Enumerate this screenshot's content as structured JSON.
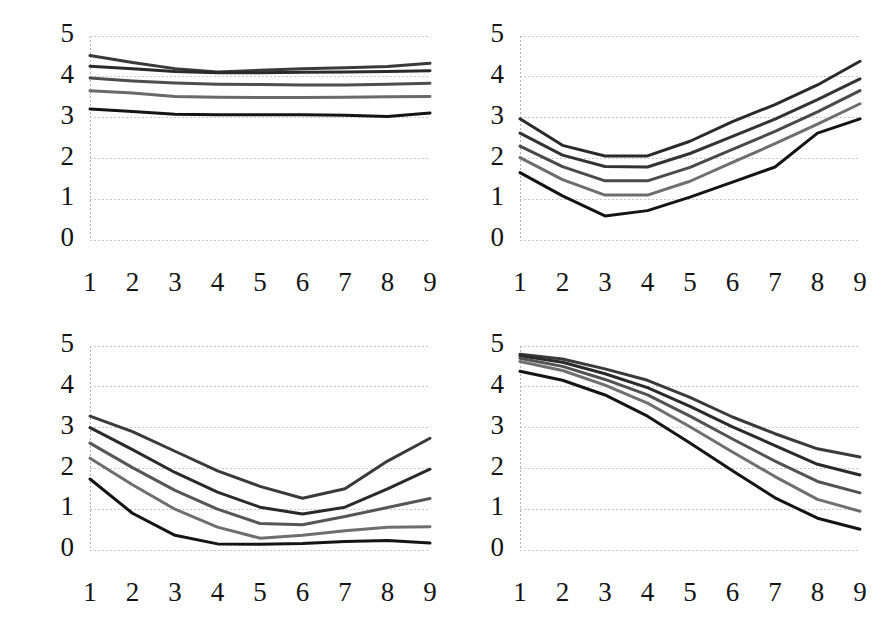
{
  "figure": {
    "background_color": "#ffffff",
    "panel_count": 4,
    "gridline_color": "#c9c9c9",
    "tick_label_color": "#141414"
  },
  "chart_data": [
    {
      "id": "panel-top-left",
      "type": "line",
      "title": "",
      "subtitle": "",
      "xlabel": "",
      "ylabel": "",
      "x": [
        1,
        2,
        3,
        4,
        5,
        6,
        7,
        8,
        9
      ],
      "xtick_labels": [
        "1",
        "2",
        "3",
        "4",
        "5",
        "6",
        "7",
        "8",
        "9"
      ],
      "ytick_labels": [
        "0",
        "1",
        "2",
        "3",
        "4",
        "5"
      ],
      "yticks": [
        0,
        1,
        2,
        3,
        4,
        5
      ],
      "ylim": [
        0,
        5
      ],
      "xlim": [
        1,
        9
      ],
      "grid": true,
      "grid_axis": "y",
      "legend": "none",
      "series": [
        {
          "name": "series-1",
          "color": "#3a3a3a",
          "values": [
            4.52,
            4.35,
            4.2,
            4.12,
            4.16,
            4.2,
            4.22,
            4.25,
            4.33
          ]
        },
        {
          "name": "series-2",
          "color": "#2a2a2a",
          "values": [
            4.26,
            4.2,
            4.13,
            4.1,
            4.1,
            4.11,
            4.12,
            4.13,
            4.15
          ]
        },
        {
          "name": "series-3",
          "color": "#4e4e4e",
          "values": [
            3.97,
            3.9,
            3.85,
            3.82,
            3.81,
            3.8,
            3.8,
            3.82,
            3.84
          ]
        },
        {
          "name": "series-4",
          "color": "#6a6a6a",
          "values": [
            3.66,
            3.6,
            3.52,
            3.5,
            3.49,
            3.49,
            3.5,
            3.51,
            3.52
          ]
        },
        {
          "name": "series-5",
          "color": "#141414",
          "values": [
            3.21,
            3.15,
            3.08,
            3.07,
            3.07,
            3.07,
            3.06,
            3.03,
            3.11
          ]
        }
      ]
    },
    {
      "id": "panel-top-right",
      "type": "line",
      "title": "",
      "subtitle": "",
      "xlabel": "",
      "ylabel": "",
      "x": [
        1,
        2,
        3,
        4,
        5,
        6,
        7,
        8,
        9
      ],
      "xtick_labels": [
        "1",
        "2",
        "3",
        "4",
        "5",
        "6",
        "7",
        "8",
        "9"
      ],
      "ytick_labels": [
        "0",
        "1",
        "2",
        "3",
        "4",
        "5"
      ],
      "yticks": [
        0,
        1,
        2,
        3,
        4,
        5
      ],
      "ylim": [
        0,
        5
      ],
      "xlim": [
        1,
        9
      ],
      "grid": true,
      "grid_axis": "y",
      "legend": "none",
      "series": [
        {
          "name": "series-1",
          "color": "#2a2a2a",
          "values": [
            2.97,
            2.32,
            2.06,
            2.06,
            2.42,
            2.9,
            3.32,
            3.8,
            4.38
          ]
        },
        {
          "name": "series-2",
          "color": "#333333",
          "values": [
            2.62,
            2.08,
            1.8,
            1.79,
            2.12,
            2.54,
            2.96,
            3.44,
            3.95
          ]
        },
        {
          "name": "series-3",
          "color": "#4a4a4a",
          "values": [
            2.3,
            1.8,
            1.45,
            1.45,
            1.78,
            2.22,
            2.66,
            3.14,
            3.66
          ]
        },
        {
          "name": "series-4",
          "color": "#6e6e6e",
          "values": [
            2.02,
            1.48,
            1.1,
            1.1,
            1.44,
            1.9,
            2.36,
            2.84,
            3.34
          ]
        },
        {
          "name": "series-5",
          "color": "#141414",
          "values": [
            1.65,
            1.08,
            0.59,
            0.72,
            1.05,
            1.42,
            1.79,
            2.62,
            2.97
          ]
        }
      ]
    },
    {
      "id": "panel-bottom-left",
      "type": "line",
      "title": "",
      "subtitle": "",
      "xlabel": "",
      "ylabel": "",
      "x": [
        1,
        2,
        3,
        4,
        5,
        6,
        7,
        8,
        9
      ],
      "xtick_labels": [
        "1",
        "2",
        "3",
        "4",
        "5",
        "6",
        "7",
        "8",
        "9"
      ],
      "ytick_labels": [
        "0",
        "1",
        "2",
        "3",
        "4",
        "5"
      ],
      "yticks": [
        0,
        1,
        2,
        3,
        4,
        5
      ],
      "ylim": [
        0,
        5
      ],
      "xlim": [
        1,
        9
      ],
      "grid": true,
      "grid_axis": "y",
      "legend": "none",
      "series": [
        {
          "name": "series-1",
          "color": "#3a3a3a",
          "values": [
            3.28,
            2.9,
            2.42,
            1.94,
            1.56,
            1.27,
            1.5,
            2.18,
            2.74
          ]
        },
        {
          "name": "series-2",
          "color": "#2a2a2a",
          "values": [
            3.0,
            2.46,
            1.9,
            1.42,
            1.05,
            0.88,
            1.05,
            1.5,
            1.98
          ]
        },
        {
          "name": "series-3",
          "color": "#565656",
          "values": [
            2.62,
            2.02,
            1.46,
            1.0,
            0.65,
            0.62,
            0.82,
            1.04,
            1.26
          ]
        },
        {
          "name": "series-4",
          "color": "#6e6e6e",
          "values": [
            2.25,
            1.6,
            1.0,
            0.56,
            0.29,
            0.36,
            0.47,
            0.56,
            0.57
          ]
        },
        {
          "name": "series-5",
          "color": "#141414",
          "values": [
            1.74,
            0.9,
            0.36,
            0.15,
            0.14,
            0.16,
            0.21,
            0.23,
            0.17
          ]
        }
      ]
    },
    {
      "id": "panel-bottom-right",
      "type": "line",
      "title": "",
      "subtitle": "",
      "xlabel": "",
      "ylabel": "",
      "x": [
        1,
        2,
        3,
        4,
        5,
        6,
        7,
        8,
        9
      ],
      "xtick_labels": [
        "1",
        "2",
        "3",
        "4",
        "5",
        "6",
        "7",
        "8",
        "9"
      ],
      "ytick_labels": [
        "0",
        "1",
        "2",
        "3",
        "4",
        "5"
      ],
      "yticks": [
        0,
        1,
        2,
        3,
        4,
        5
      ],
      "ylim": [
        0,
        5
      ],
      "xlim": [
        1,
        9
      ],
      "grid": true,
      "grid_axis": "y",
      "legend": "none",
      "series": [
        {
          "name": "series-1",
          "color": "#3a3a3a",
          "values": [
            4.8,
            4.68,
            4.44,
            4.16,
            3.74,
            3.26,
            2.85,
            2.48,
            2.28
          ]
        },
        {
          "name": "series-2",
          "color": "#2a2a2a",
          "values": [
            4.76,
            4.6,
            4.32,
            3.98,
            3.52,
            3.02,
            2.56,
            2.1,
            1.84
          ]
        },
        {
          "name": "series-3",
          "color": "#525252",
          "values": [
            4.7,
            4.5,
            4.18,
            3.8,
            3.28,
            2.72,
            2.18,
            1.68,
            1.4
          ]
        },
        {
          "name": "series-4",
          "color": "#707070",
          "values": [
            4.62,
            4.4,
            4.04,
            3.6,
            3.02,
            2.4,
            1.8,
            1.24,
            0.95
          ]
        },
        {
          "name": "series-5",
          "color": "#141414",
          "values": [
            4.38,
            4.16,
            3.8,
            3.28,
            2.62,
            1.94,
            1.28,
            0.78,
            0.51
          ]
        }
      ]
    }
  ]
}
